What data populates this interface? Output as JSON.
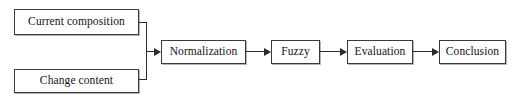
{
  "diagram": {
    "orientation": "left-to-right",
    "background_color": "#ffffff",
    "border_color": "#3a3a3a",
    "line_color": "#2b2b2b",
    "text_color": "#121212",
    "nodes": [
      {
        "id": "current-composition",
        "label": "Current composition",
        "type": "process-box",
        "role": "input"
      },
      {
        "id": "change-content",
        "label": "Change content",
        "type": "process-box",
        "role": "input"
      },
      {
        "id": "normalization",
        "label": "Normalization",
        "type": "process-box",
        "role": "stage"
      },
      {
        "id": "fuzzy",
        "label": "Fuzzy",
        "type": "process-box",
        "role": "stage"
      },
      {
        "id": "evaluation",
        "label": "Evaluation",
        "type": "process-box",
        "role": "stage"
      },
      {
        "id": "conclusion",
        "label": "Conclusion",
        "type": "process-box",
        "role": "output"
      }
    ],
    "edges": [
      {
        "from": "current-composition",
        "to": "normalization",
        "style": "elbow-merge",
        "arrow": true
      },
      {
        "from": "change-content",
        "to": "normalization",
        "style": "elbow-merge",
        "arrow": true
      },
      {
        "from": "normalization",
        "to": "fuzzy",
        "style": "straight",
        "arrow": true
      },
      {
        "from": "fuzzy",
        "to": "evaluation",
        "style": "straight",
        "arrow": true
      },
      {
        "from": "evaluation",
        "to": "conclusion",
        "style": "straight",
        "arrow": true
      }
    ]
  }
}
